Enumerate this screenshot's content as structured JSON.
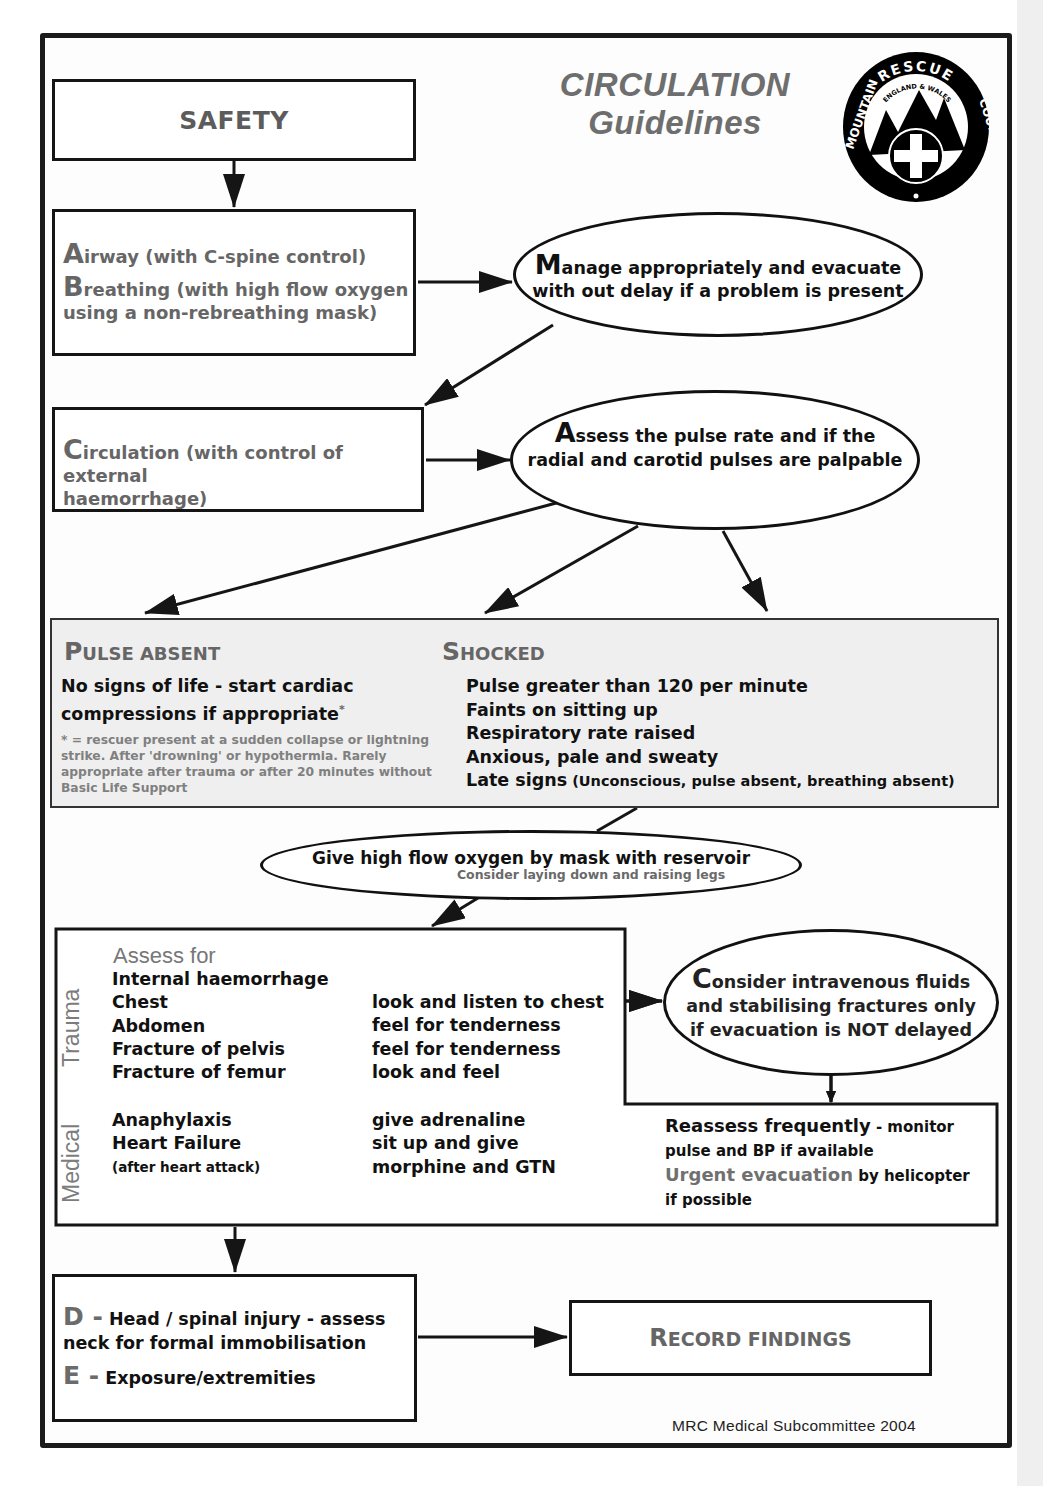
{
  "title": {
    "line1": "CIRCULATION",
    "line2": "Guidelines"
  },
  "logo": {
    "outer_text": "MOUNTAIN RESCUE COUNCIL",
    "inner_text": "ENGLAND & WALES",
    "icon": "mountain-cross-logo-icon"
  },
  "safety": {
    "label": "SAFETY"
  },
  "ab_box": {
    "airway_initial": "A",
    "airway_text": "irway (with C-spine control)",
    "breathing_initial": "B",
    "breathing_text": "reathing (with high flow oxygen",
    "breathing_text2": "using a non-rebreathing mask)"
  },
  "manage": {
    "initial": "M",
    "text": "anage appropriately and evacuate with out delay if a problem is present"
  },
  "circulation_box": {
    "initial": "C",
    "text": "irculation (with control of external",
    "text2": "haemorrhage)"
  },
  "assess_pulse": {
    "initial": "A",
    "text": "ssess the pulse rate and if the",
    "text2": "radial and carotid pulses are palpable"
  },
  "pulse_absent": {
    "heading_cap": "P",
    "heading_rest": "ULSE ABSENT",
    "main": "No signs of life - start cardiac compressions if appropriate",
    "asterisk": "*",
    "note": "* = rescuer present at a sudden collapse or lightning strike. After 'drowning' or hypothermia. Rarely appropriate after trauma or after 20 minutes without Basic Life Support"
  },
  "shocked": {
    "heading_cap": "S",
    "heading_rest": "HOCKED",
    "items": [
      "Pulse greater than 120 per minute",
      "Faints on sitting up",
      "Respiratory rate raised",
      "Anxious, pale and sweaty"
    ],
    "late_label": "Late signs",
    "late_detail": " (Unconscious, pulse absent, breathing absent)"
  },
  "oxygen": {
    "main": "Give high flow oxygen by mask with reservoir",
    "sub": "Consider laying down and raising legs"
  },
  "assess_for": {
    "heading": "Assess for",
    "trauma_label": "Trauma",
    "medical_label": "Medical",
    "trauma_rows": [
      {
        "condition": "Internal haemorrhage",
        "action": ""
      },
      {
        "condition": "Chest",
        "action": "look and listen to chest"
      },
      {
        "condition": "Abdomen",
        "action": "feel for tenderness"
      },
      {
        "condition": "Fracture of pelvis",
        "action": "feel for tenderness"
      },
      {
        "condition": "Fracture of femur",
        "action": "look and feel"
      }
    ],
    "medical_rows": [
      {
        "condition": "Anaphylaxis",
        "action": "give adrenaline"
      },
      {
        "condition": "Heart Failure",
        "action": "sit up and give"
      },
      {
        "condition": "(after heart attack)",
        "action": "morphine and GTN"
      }
    ]
  },
  "consider": {
    "initial": "C",
    "text": "onsider intravenous fluids and stabilising fractures only if evacuation is NOT delayed"
  },
  "reassess": {
    "bold": "Reassess frequently",
    "rest": " - monitor pulse and BP if available",
    "urgent": "Urgent evacuation",
    "urgent_rest": " by helicopter if possible"
  },
  "de_box": {
    "d_letter": "D -",
    "d_text": "Head / spinal injury - assess",
    "d_text2": "neck for formal immobilisation",
    "e_letter": "E -",
    "e_text": "Exposure/extremities"
  },
  "record": {
    "cap": "R",
    "rest": "ECORD FINDINGS"
  },
  "footer": {
    "credit": "MRC Medical Subcommittee 2004"
  },
  "colors": {
    "line": "#151515",
    "grey_text": "#6b6b6b",
    "panel_grey": "#efefef",
    "strip": "#efefef"
  }
}
